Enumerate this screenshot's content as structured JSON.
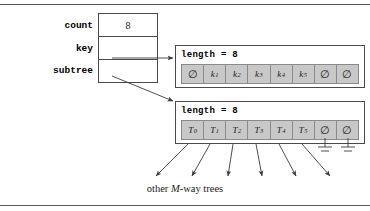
{
  "figure": {
    "caption_prefix": "other ",
    "caption_em": "M",
    "caption_suffix": "-way trees"
  },
  "record": {
    "fields": [
      {
        "label": "count",
        "value": "8"
      },
      {
        "label": "key",
        "value": ""
      },
      {
        "label": "subtree",
        "value": ""
      }
    ]
  },
  "key_array": {
    "title": "length = 8",
    "cells": [
      {
        "base": "∅",
        "sub": "",
        "null": true
      },
      {
        "base": "k",
        "sub": "1",
        "null": false
      },
      {
        "base": "k",
        "sub": "2",
        "null": false
      },
      {
        "base": "k",
        "sub": "3",
        "null": false
      },
      {
        "base": "k",
        "sub": "4",
        "null": false
      },
      {
        "base": "k",
        "sub": "5",
        "null": false
      },
      {
        "base": "∅",
        "sub": "",
        "null": true
      },
      {
        "base": "∅",
        "sub": "",
        "null": true
      }
    ]
  },
  "subtree_array": {
    "title": "length = 8",
    "cells": [
      {
        "base": "T",
        "sub": "0",
        "null": false
      },
      {
        "base": "T",
        "sub": "1",
        "null": false
      },
      {
        "base": "T",
        "sub": "2",
        "null": false
      },
      {
        "base": "T",
        "sub": "3",
        "null": false
      },
      {
        "base": "T",
        "sub": "4",
        "null": false
      },
      {
        "base": "T",
        "sub": "5",
        "null": false
      },
      {
        "base": "∅",
        "sub": "",
        "null": true
      },
      {
        "base": "∅",
        "sub": "",
        "null": true
      }
    ]
  },
  "colors": {
    "cell_fill": "#c8c8c8",
    "cell_border": "#8a8a8a",
    "line": "#4a4a4a",
    "rule": "#555a5e"
  }
}
